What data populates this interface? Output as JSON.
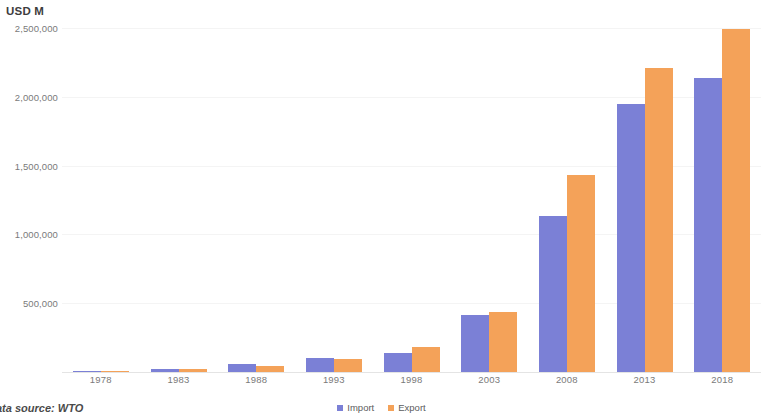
{
  "chart_data": {
    "type": "bar",
    "title": "USD M",
    "xlabel": "",
    "ylabel": "USD M",
    "categories": [
      "1978",
      "1983",
      "1988",
      "1993",
      "1998",
      "2003",
      "2008",
      "2013",
      "2018"
    ],
    "series": [
      {
        "name": "Import",
        "color": "#7b80d6",
        "values": [
          11000,
          21000,
          55000,
          104000,
          140000,
          413000,
          1133000,
          1950000,
          2135000
        ]
      },
      {
        "name": "Export",
        "color": "#f4a259",
        "values": [
          10000,
          22000,
          47000,
          91000,
          184000,
          438000,
          1430000,
          2210000,
          2490000
        ]
      }
    ],
    "ylim": [
      0,
      2500000
    ],
    "y_ticks": [
      0,
      500000,
      1000000,
      1500000,
      2000000,
      2500000
    ],
    "y_tick_labels": [
      "",
      "500,000",
      "1,000,000",
      "1,500,000",
      "2,000,000",
      "2,500,000"
    ],
    "grid": true,
    "legend_position": "bottom"
  },
  "footer": {
    "source_note": "ata source: WTO"
  },
  "legend": {
    "items": [
      {
        "label": "Import"
      },
      {
        "label": "Export"
      }
    ]
  }
}
